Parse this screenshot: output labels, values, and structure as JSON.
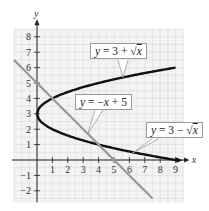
{
  "chart_data": {
    "type": "line",
    "title": "",
    "xlabel": "x",
    "ylabel": "y",
    "xlim": [
      -2,
      9.5
    ],
    "ylim": [
      -2.5,
      8.5
    ],
    "grid": true,
    "x_ticks": [
      1,
      2,
      3,
      4,
      5,
      6,
      7,
      8,
      9
    ],
    "y_ticks": [
      -2,
      -1,
      1,
      2,
      3,
      4,
      5,
      6,
      7,
      8
    ],
    "series": [
      {
        "name": "y = 3 + √x",
        "expression": "3 + sqrt(x)",
        "domain": [
          0,
          9
        ],
        "color": "#111111",
        "points": [
          [
            0,
            3
          ],
          [
            1,
            4
          ],
          [
            4,
            5
          ],
          [
            9,
            6
          ]
        ]
      },
      {
        "name": "y = 3 − √x",
        "expression": "3 - sqrt(x)",
        "domain": [
          0,
          9
        ],
        "color": "#111111",
        "points": [
          [
            0,
            3
          ],
          [
            1,
            2
          ],
          [
            4,
            1
          ],
          [
            9,
            0
          ]
        ]
      },
      {
        "name": "y = −x + 5",
        "expression": "-x + 5",
        "domain": [
          -1.5,
          7.5
        ],
        "color": "#999999",
        "points": [
          [
            -1.5,
            6.5
          ],
          [
            0,
            5
          ],
          [
            4,
            1
          ],
          [
            5,
            0
          ],
          [
            7.5,
            -2.5
          ]
        ]
      }
    ],
    "annotations": [
      "y = 3 + √x",
      "y = −x + 5",
      "y = 3 − √x"
    ]
  },
  "labels": {
    "upper": {
      "lhs": "y",
      "rest": " = 3 + √",
      "var": "x"
    },
    "line": {
      "lhs": "y",
      "rest": " = −",
      "var": "x",
      "tail": " + 5"
    },
    "lower": {
      "lhs": "y",
      "rest": " = 3 − √",
      "var": "x"
    }
  },
  "axes": {
    "x": "x",
    "y": "y"
  }
}
